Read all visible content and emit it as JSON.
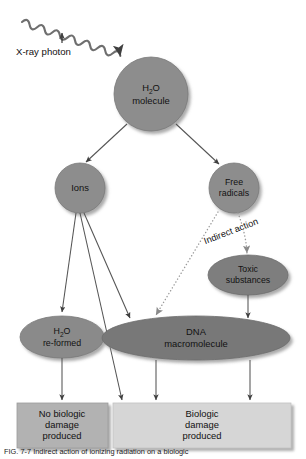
{
  "figure": {
    "caption": "FIG. 7-7 Indirect action of ionizing radiation on a biologic"
  },
  "photon": {
    "label": "X-ray photon",
    "icon": "wavy-arrow-icon"
  },
  "nodes": {
    "water": {
      "line1": "H",
      "sub1": "2",
      "line1b": "O",
      "line2": "molecule",
      "shape": "circle",
      "fill": "#8d8d8d"
    },
    "ions": {
      "line1": "Ions",
      "shape": "circle",
      "fill": "#8d8d8d"
    },
    "free_radicals": {
      "line1": "Free",
      "line2": "radicals",
      "shape": "circle",
      "fill": "#8d8d8d"
    },
    "toxic": {
      "line1": "Toxic",
      "line2": "substances",
      "shape": "ellipse",
      "fill": "#7e7e7e"
    },
    "water_reformed": {
      "line1": "H",
      "sub1": "2",
      "line1b": "O",
      "line2": "re-formed",
      "shape": "ellipse",
      "fill": "#8a8a8a"
    },
    "dna": {
      "line1": "DNA",
      "line2": "macromolecule",
      "shape": "ellipse",
      "fill": "#787878"
    }
  },
  "edges": {
    "indirect_action_label": "Indirect action"
  },
  "outcomes": {
    "no_damage": {
      "line1": "No biologic",
      "line2": "damage",
      "line3": "produced",
      "fill": "#b2b2b2"
    },
    "damage": {
      "line1": "Biologic",
      "line2": "damage",
      "line3": "produced",
      "fill": "#d6d6d6"
    }
  },
  "colors": {
    "node_gray": "#8d8d8d",
    "dark_node_gray": "#787878",
    "box_dark": "#b2b2b2",
    "box_light": "#d6d6d6",
    "stroke": "#4a4a4a",
    "background": "#ffffff"
  }
}
